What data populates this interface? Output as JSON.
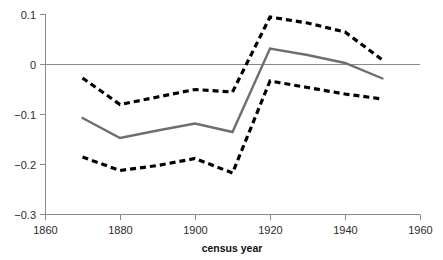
{
  "chart_data": {
    "type": "line",
    "title": "",
    "subtitle": "",
    "xlabel": "census year",
    "ylabel": "",
    "xlim": [
      1860,
      1960
    ],
    "ylim": [
      -0.3,
      0.1
    ],
    "grid": false,
    "legend_position": "none",
    "x": [
      1870,
      1880,
      1890,
      1900,
      1910,
      1920,
      1930,
      1940,
      1950
    ],
    "xticks": [
      1860,
      1880,
      1900,
      1920,
      1940,
      1960
    ],
    "xtick_labels": [
      "1860",
      "1880",
      "1900",
      "1920",
      "1940",
      "1960"
    ],
    "yticks": [
      0.1,
      0,
      -0.1,
      -0.2,
      -0.3
    ],
    "ytick_labels": [
      "0.1",
      "0",
      "−0.1",
      "−0.2",
      "−0.3"
    ],
    "zero_line": 0,
    "series": [
      {
        "name": "upper confidence bound",
        "style": "dashed",
        "color": "#000000",
        "values": [
          -0.028,
          -0.081,
          -0.066,
          -0.051,
          -0.056,
          0.094,
          0.082,
          0.064,
          0.008
        ]
      },
      {
        "name": "point estimate",
        "style": "solid",
        "color": "#6e6e6e",
        "values": [
          -0.108,
          -0.148,
          -0.133,
          -0.119,
          -0.136,
          0.031,
          0.018,
          0.002,
          -0.029
        ]
      },
      {
        "name": "lower confidence bound",
        "style": "dashed",
        "color": "#000000",
        "values": [
          -0.186,
          -0.213,
          -0.203,
          -0.189,
          -0.218,
          -0.034,
          -0.047,
          -0.06,
          -0.07
        ]
      }
    ]
  },
  "axes": {
    "x_title": "census year"
  },
  "colors": {
    "axis": "#8a8a8a",
    "estimate": "#6e6e6e",
    "bounds": "#000000",
    "text": "#2b2b2b",
    "background": "#ffffff"
  }
}
